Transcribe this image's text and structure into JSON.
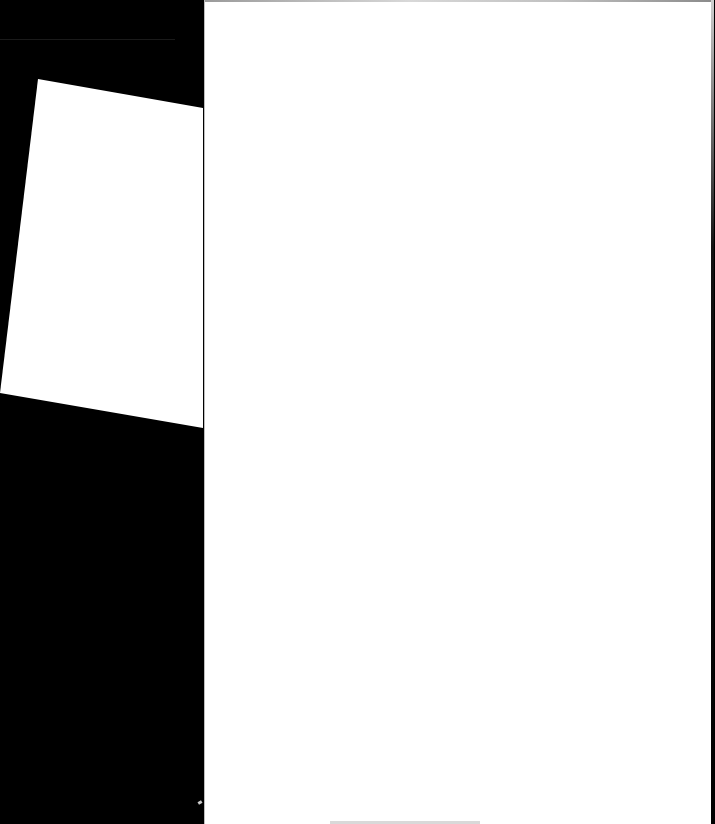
{
  "scene": {
    "description_label": "",
    "background_color": "#000000",
    "sheets": [
      {
        "id": "tilted-sheet",
        "color": "#ffffff",
        "points": "38,79 203,108 203,428 0,393"
      },
      {
        "id": "main-page",
        "color": "#ffffff"
      }
    ]
  }
}
